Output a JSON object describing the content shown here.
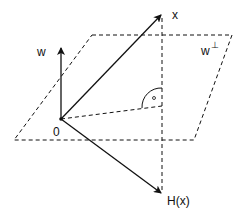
{
  "diagram": {
    "colors": {
      "stroke": "#111111",
      "background": "#ffffff"
    },
    "labels": {
      "origin": "0",
      "w": "w",
      "x": "x",
      "w_perp_base": "w",
      "w_perp_sup": "⊥",
      "hx": "H(x)"
    },
    "elements": {
      "plane": "hyperplane parallelogram (dashed)",
      "vector_w": "normal vector w",
      "vector_x": "vector x",
      "vector_hx": "reflected vector H(x)",
      "perpendicular": "vertical dashed line through x and H(x)",
      "projection_line": "dashed line from 0 to foot of perpendicular",
      "right_angle_marker": "arc with dot"
    }
  }
}
